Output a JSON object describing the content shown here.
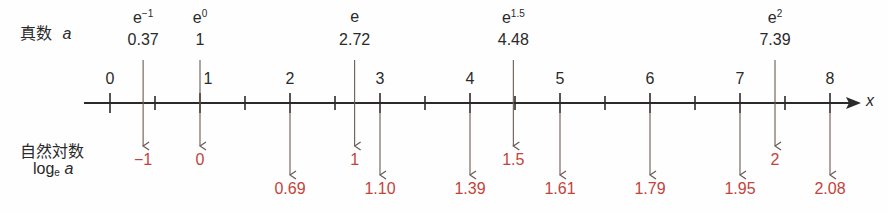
{
  "labels": {
    "antilog_label": "真数",
    "antilog_var": "a",
    "natlog_label": "自然対数",
    "natlog_prefix": "log",
    "natlog_base": "e",
    "natlog_var": "a",
    "axis_var": "x"
  },
  "axis": {
    "ticks": [
      "0",
      "1",
      "2",
      "3",
      "4",
      "5",
      "6",
      "7",
      "8"
    ]
  },
  "special": [
    {
      "base": "e",
      "exp": "−1",
      "value": "0.37",
      "log": "−1"
    },
    {
      "base": "e",
      "exp": "0",
      "value": "1",
      "log": "0"
    },
    {
      "base": "e",
      "exp": "",
      "value": "2.72",
      "log": "1"
    },
    {
      "base": "e",
      "exp": "1.5",
      "value": "4.48",
      "log": "1.5"
    },
    {
      "base": "e",
      "exp": "2",
      "value": "7.39",
      "log": "2"
    }
  ],
  "integer_logs": [
    {
      "a": "2",
      "log": "0.69"
    },
    {
      "a": "3",
      "log": "1.10"
    },
    {
      "a": "4",
      "log": "1.39"
    },
    {
      "a": "5",
      "log": "1.61"
    },
    {
      "a": "6",
      "log": "1.79"
    },
    {
      "a": "7",
      "log": "1.95"
    },
    {
      "a": "8",
      "log": "2.08"
    }
  ],
  "colors": {
    "line": "#2a2a2a",
    "arrow": "#6b5a55",
    "accent_red": "#c0443a"
  }
}
